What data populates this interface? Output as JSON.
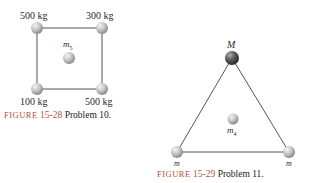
{
  "figure_15_28": {
    "masses": {
      "top_left": "500 kg",
      "top_right": "300 kg",
      "bottom_left": "100 kg",
      "bottom_right": "500 kg",
      "center": "m",
      "center_sub": "5"
    },
    "caption": {
      "figure_label": "FIGURE",
      "figure_number": "15-28",
      "problem": "Problem 10."
    }
  },
  "figure_15_29": {
    "masses": {
      "top": "M",
      "bottom_left": "m",
      "bottom_right": "m",
      "center": "m",
      "center_sub": "4"
    },
    "caption": {
      "figure_label": "FIGURE",
      "figure_number": "15-29",
      "problem": "Problem 11."
    }
  },
  "colors": {
    "sphere_light": "#c8c8c8",
    "sphere_dark": "#5a5a5a",
    "line": "#555555",
    "caption_accent": "#b05530"
  }
}
